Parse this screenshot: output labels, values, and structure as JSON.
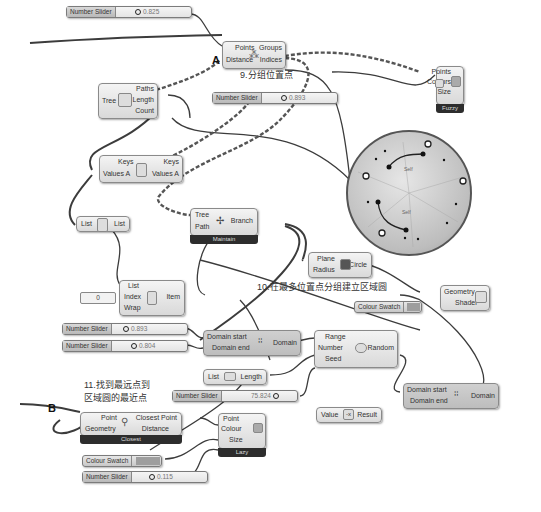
{
  "canvas": {
    "sliders": [
      {
        "id": "s1",
        "name": "Number Slider",
        "value": "0.825"
      },
      {
        "id": "s2",
        "name": "Number Slider",
        "value": "0.893"
      },
      {
        "id": "s3",
        "name": "Number Slider",
        "value": "0.893"
      },
      {
        "id": "s4",
        "name": "Number Slider",
        "value": "0.804"
      },
      {
        "id": "s5",
        "name": "Number Slider",
        "value": "75.824"
      },
      {
        "id": "s6",
        "name": "Number Slider",
        "value": "0.115"
      }
    ],
    "nodes": {
      "group": {
        "inputs": [
          "Points",
          "Distance"
        ],
        "outputs": [
          "Groups",
          "Indices"
        ]
      },
      "treestat": {
        "inputs": [
          "Tree"
        ],
        "outputs": [
          "Paths",
          "Length",
          "Count"
        ]
      },
      "sort": {
        "inputs": [
          "Keys",
          "Values A"
        ],
        "outputs": [
          "Keys",
          "Values A"
        ]
      },
      "reverse": {
        "inputs": [
          "List"
        ],
        "outputs": [
          "List"
        ]
      },
      "branch": {
        "inputs": [
          "Tree",
          "Path"
        ],
        "outputs": [
          "Branch"
        ],
        "footer": "Maintain"
      },
      "item": {
        "inputs": [
          "List",
          "Index",
          "Wrap"
        ],
        "outputs": [
          "Item"
        ]
      },
      "panel_value": "0",
      "circle": {
        "inputs": [
          "Plane",
          "Radius"
        ],
        "outputs": [
          "Circle"
        ]
      },
      "preview": {
        "inputs": [
          "Geometry",
          "Shader"
        ]
      },
      "domain1": {
        "inputs": [
          "Domain start",
          "Domain end"
        ],
        "outputs": [
          "Domain"
        ]
      },
      "listlen": {
        "inputs": [
          "List"
        ],
        "outputs": [
          "Length"
        ]
      },
      "random": {
        "inputs": [
          "Range",
          "Number",
          "Seed"
        ],
        "outputs": [
          "Random"
        ]
      },
      "domain2": {
        "inputs": [
          "Domain start",
          "Domain end"
        ],
        "outputs": [
          "Domain"
        ]
      },
      "negative": {
        "inputs": [
          "Value"
        ],
        "outputs": [
          "Result"
        ]
      },
      "closest": {
        "inputs": [
          "Point",
          "Geometry"
        ],
        "outputs": [
          "Closest Point",
          "Distance"
        ],
        "footer": "Closest"
      },
      "display1": {
        "inputs": [
          "Points",
          "Colours",
          "Size"
        ],
        "footer": "Fuzzy"
      },
      "display2": {
        "inputs": [
          "Point",
          "Colour",
          "Size"
        ],
        "footer": "Lazy"
      }
    },
    "swatches": [
      {
        "id": "cs1",
        "name": "Colour Swatch",
        "color": "#9e9e9e"
      },
      {
        "id": "cs2",
        "name": "Colour Swatch",
        "color": "#9e9e9e"
      }
    ],
    "annotations": {
      "a9": "9.分组位置点",
      "a10": "10.在最多位置点分组建立区域圆",
      "a11_line1": "11.找到最远点到",
      "a11_line2": "区域圆的最近点",
      "letterA": "A",
      "letterB": "B"
    },
    "viewport": {
      "label_top": "Self",
      "label_bottom": "Self"
    }
  }
}
